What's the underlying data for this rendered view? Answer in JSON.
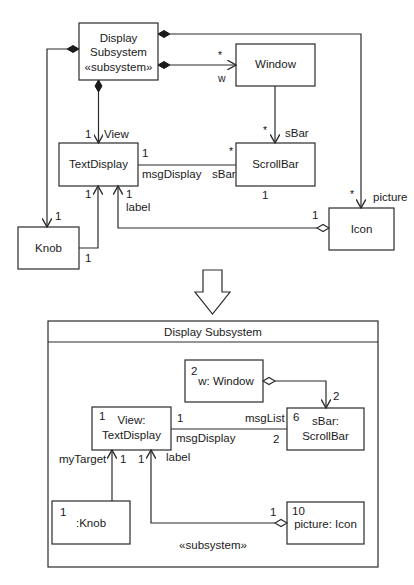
{
  "class_diagram": {
    "classes": {
      "display_subsystem": {
        "line1": "Display",
        "line2": "Subsystem",
        "stereotype": "«subsystem»"
      },
      "window": {
        "name": "Window"
      },
      "text_display": {
        "name": "TextDisplay"
      },
      "scroll_bar": {
        "name": "ScrollBar"
      },
      "knob": {
        "name": "Knob"
      },
      "icon": {
        "name": "Icon"
      }
    },
    "labels": {
      "window_mult": "*",
      "window_role": "w",
      "view_mult": "1",
      "view_role": "View",
      "window_sbar_mult": "*",
      "window_sbar_role": "sBar",
      "td_msg_mult": "1",
      "td_msg_role": "msgDisplay",
      "sb_mult": "*",
      "sb_role": "sBar",
      "sb_bottom_mult": "1",
      "knob_mult": "1",
      "knob_td_mult": "1",
      "knob_bottom_mult": "1",
      "label_mult": "1",
      "label_role": "label",
      "icon_agg_mult": "1",
      "icon_mult": "*",
      "icon_role": "picture"
    }
  },
  "transform_arrow": "down-arrow",
  "composite_structure": {
    "title": "Display Subsystem",
    "stereotype": "«subsystem»",
    "parts": {
      "window": {
        "multiplicity": "2",
        "name": "w: Window"
      },
      "view": {
        "multiplicity": "1",
        "line1": "View:",
        "line2": "TextDisplay"
      },
      "sbar": {
        "multiplicity": "6",
        "line1": "sBar:",
        "line2": "ScrollBar"
      },
      "knob": {
        "multiplicity": "1",
        "name": ":Knob"
      },
      "picture": {
        "multiplicity": "10",
        "name": "picture: Icon"
      }
    },
    "labels": {
      "w_sbar_mult": "2",
      "view_msg_mult": "1",
      "msg_display_role": "msgDisplay",
      "msg_list_role": "msgList",
      "sbar_msg_mult": "2",
      "my_target_role": "myTarget",
      "knob_view_mult": "1",
      "label_view_mult": "1",
      "label_role": "label",
      "picture_agg_mult": "1"
    }
  }
}
